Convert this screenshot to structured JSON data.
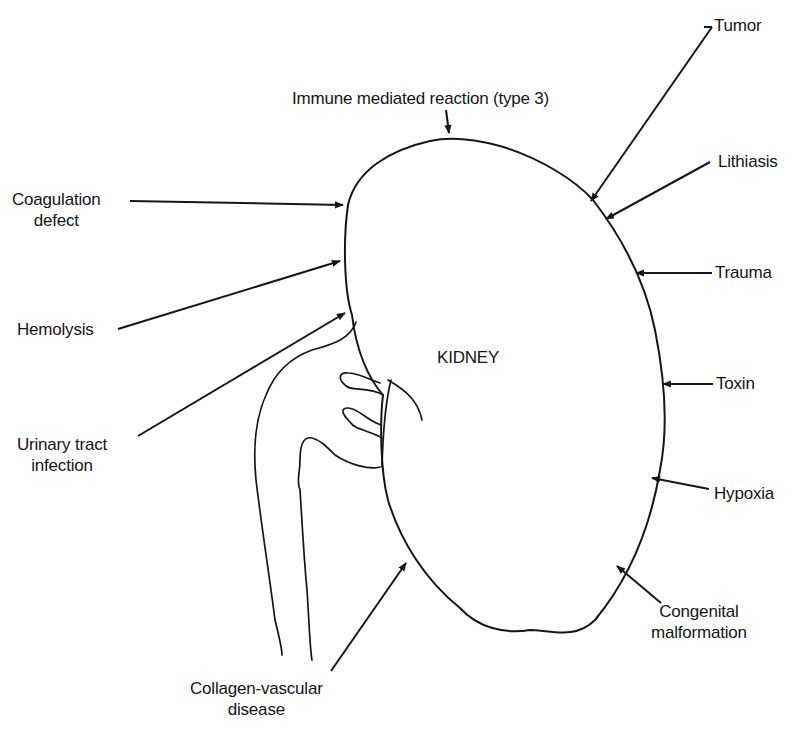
{
  "diagram": {
    "organ_label": "KIDNEY",
    "labels": [
      {
        "id": "tumor",
        "lines": [
          "Tumor"
        ]
      },
      {
        "id": "immune",
        "lines": [
          "Immune mediated reaction (type 3)"
        ]
      },
      {
        "id": "lithiasis",
        "lines": [
          "Lithiasis"
        ]
      },
      {
        "id": "coagulation",
        "lines": [
          "Coagulation",
          "defect"
        ]
      },
      {
        "id": "trauma",
        "lines": [
          "Trauma"
        ]
      },
      {
        "id": "hemolysis",
        "lines": [
          "Hemolysis"
        ]
      },
      {
        "id": "toxin",
        "lines": [
          "Toxin"
        ]
      },
      {
        "id": "uti",
        "lines": [
          "Urinary tract",
          "infection"
        ]
      },
      {
        "id": "hypoxia",
        "lines": [
          "Hypoxia"
        ]
      },
      {
        "id": "congenital",
        "lines": [
          "Congenital",
          "malformation"
        ]
      },
      {
        "id": "collagen",
        "lines": [
          "Collagen-vascular",
          "disease"
        ]
      }
    ],
    "colors": {
      "background": "#ffffff",
      "ink": "#161616"
    }
  }
}
